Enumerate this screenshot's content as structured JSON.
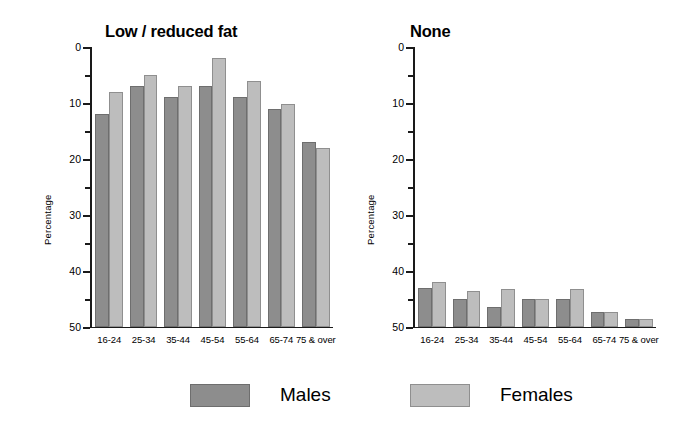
{
  "chart_data": {
    "type": "bar",
    "title": "",
    "xlabel": "",
    "ylabel": "Percentage",
    "ylim": [
      0,
      50
    ],
    "yticks": [
      0,
      10,
      20,
      30,
      40,
      50
    ],
    "yminorticks": [
      5,
      15,
      25,
      35,
      45
    ],
    "grid": false,
    "legend": {
      "position": "bottom",
      "entries": [
        {
          "name": "Males",
          "color": "#8d8d8d"
        },
        {
          "name": "Females",
          "color": "#bdbdbd"
        }
      ]
    },
    "categories": [
      "16-24",
      "25-34",
      "35-44",
      "45-54",
      "55-64",
      "65-74",
      "75 & over"
    ],
    "panels": [
      {
        "title": "Low / reduced fat",
        "ylabel": "Percentage",
        "series": [
          {
            "name": "Males",
            "values": [
              38,
              43,
              41,
              43,
              41,
              39,
              33
            ]
          },
          {
            "name": "Females",
            "values": [
              42,
              45,
              43,
              48,
              44,
              39.8,
              32
            ]
          }
        ]
      },
      {
        "title": "None",
        "ylabel": "Percentage",
        "series": [
          {
            "name": "Males",
            "values": [
              7,
              5,
              3.5,
              5,
              5,
              2.7,
              1.5
            ]
          },
          {
            "name": "Females",
            "values": [
              8,
              6.5,
              6.8,
              5,
              6.7,
              2.7,
              1.5
            ]
          }
        ]
      }
    ]
  },
  "axis": {
    "tick_labels": [
      "50",
      "40",
      "30",
      "20",
      "10",
      "0"
    ],
    "tick_values": [
      50,
      40,
      30,
      20,
      10,
      0
    ],
    "minor_values": [
      45,
      35,
      25,
      15,
      5
    ]
  },
  "legend": {
    "males_label": "Males",
    "females_label": "Females"
  },
  "colors": {
    "males": "#8d8d8d",
    "females": "#bdbdbd",
    "axis": "#1a1a1a",
    "background": "#ffffff"
  }
}
